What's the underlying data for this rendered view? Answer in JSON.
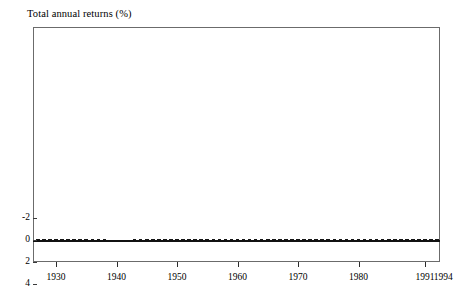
{
  "chart_data": {
    "type": "bar",
    "title": "Total annual returns (%)",
    "xlabel": "",
    "ylabel": "",
    "ylim": [
      -2,
      16
    ],
    "yticks": [
      -2,
      0,
      2,
      4,
      6,
      8,
      10,
      12,
      14,
      16
    ],
    "ytick_labels": [
      "-2",
      "0",
      "2",
      "4",
      "6",
      "8",
      "10",
      "12",
      "14",
      "16"
    ],
    "xlim": [
      1925,
      1995
    ],
    "xticks": [
      1930,
      1940,
      1950,
      1960,
      1970,
      1980,
      1991,
      1994
    ],
    "xtick_labels": [
      "1930",
      "1940",
      "1950",
      "1960",
      "1970",
      "1980",
      "1991",
      "1994"
    ],
    "grid": false,
    "legend": null,
    "bar_color": "#161616",
    "categories": [
      1926,
      1927,
      1928,
      1929,
      1930,
      1931,
      1932,
      1933,
      1934,
      1935,
      1936,
      1937,
      1938,
      1939,
      1940,
      1941,
      1942,
      1943,
      1944,
      1945,
      1946,
      1947,
      1948,
      1949,
      1950,
      1951,
      1952,
      1953,
      1954,
      1955,
      1956,
      1957,
      1958,
      1959,
      1960,
      1961,
      1962,
      1963,
      1964,
      1965,
      1966,
      1967,
      1968,
      1969,
      1970,
      1971,
      1972,
      1973,
      1974,
      1975,
      1976,
      1977,
      1978,
      1979,
      1980,
      1981,
      1982,
      1983,
      1984,
      1985,
      1986,
      1987,
      1988,
      1989,
      1990,
      1991,
      1992,
      1993,
      1994
    ],
    "values": [
      3.3,
      3.2,
      3.5,
      4.6,
      2.4,
      0.9,
      0.8,
      0.5,
      0.4,
      0.3,
      0.2,
      0.2,
      0.1,
      0.0,
      0.0,
      0.0,
      0.0,
      0.4,
      0.4,
      0.4,
      0.4,
      0.5,
      0.7,
      1.1,
      1.2,
      1.5,
      1.6,
      1.8,
      0.9,
      1.6,
      2.1,
      3.1,
      1.5,
      2.9,
      2.7,
      2.1,
      2.7,
      3.1,
      3.5,
      3.9,
      4.8,
      4.2,
      5.2,
      6.6,
      6.5,
      4.4,
      4.1,
      7.0,
      7.9,
      5.8,
      5.1,
      5.1,
      7.2,
      10.4,
      11.2,
      14.7,
      10.5,
      8.8,
      9.8,
      7.7,
      6.2,
      5.5,
      6.4,
      8.4,
      7.8,
      5.6,
      3.5,
      3.0,
      4.1
    ]
  }
}
